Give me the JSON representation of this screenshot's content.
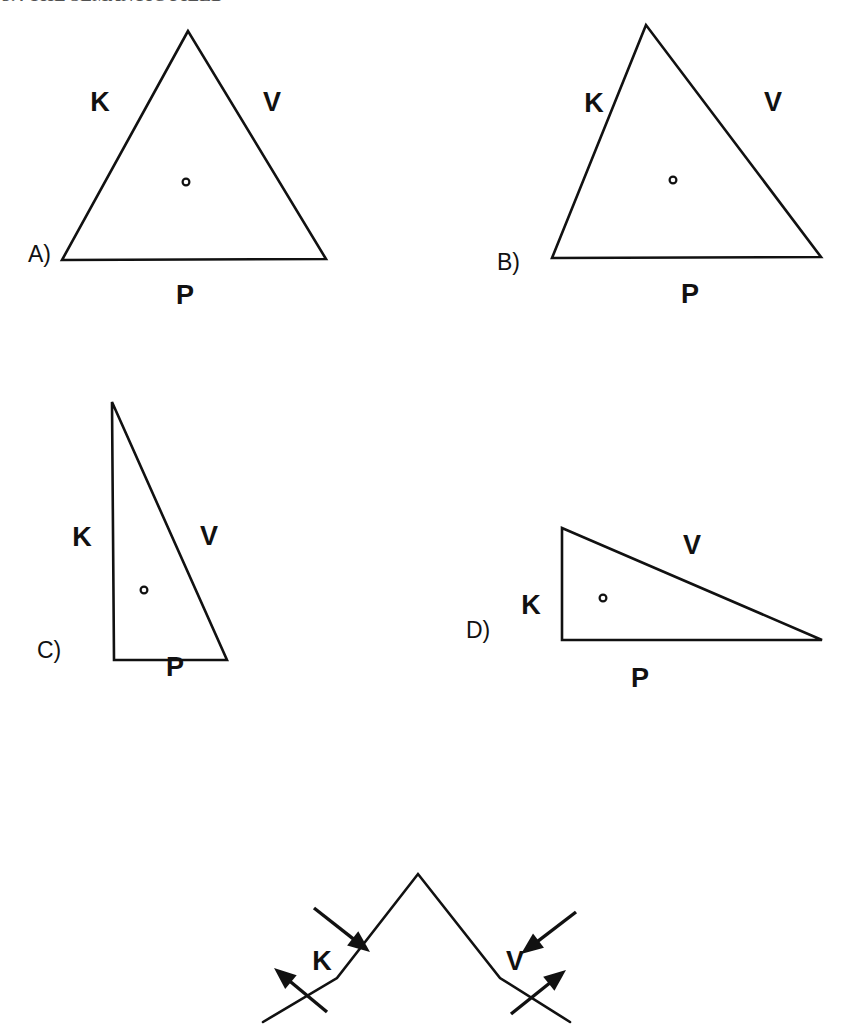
{
  "page": {
    "width": 848,
    "height": 1026,
    "background_color": "#ffffff",
    "ink_color": "#111111",
    "header_sliver_text": "3.4  THE SEMANTIC FIELD"
  },
  "figure": {
    "kind": "geometric-diagram",
    "vertex_labels": [
      "K",
      "V",
      "P"
    ],
    "panels": [
      {
        "id": "A",
        "panel_label": "A)",
        "panel_label_pos": [
          28,
          256
        ],
        "shape": "triangle",
        "vertices": [
          [
            188,
            31
          ],
          [
            62,
            260
          ],
          [
            326,
            259
          ]
        ],
        "interior_point": [
          186,
          182
        ],
        "labels": [
          {
            "text": "K",
            "pos": [
              100,
              104
            ],
            "side": "left"
          },
          {
            "text": "V",
            "pos": [
              272,
              104
            ],
            "side": "right"
          },
          {
            "text": "P",
            "pos": [
              185,
              297
            ],
            "side": "bottom"
          }
        ]
      },
      {
        "id": "B",
        "panel_label": "B)",
        "panel_label_pos": [
          497,
          264
        ],
        "shape": "triangle",
        "vertices": [
          [
            646,
            25
          ],
          [
            552,
            258
          ],
          [
            821,
            257
          ]
        ],
        "interior_point": [
          673,
          180
        ],
        "labels": [
          {
            "text": "K",
            "pos": [
              594,
              105
            ],
            "side": "left"
          },
          {
            "text": "V",
            "pos": [
              773,
              104
            ],
            "side": "right"
          },
          {
            "text": "P",
            "pos": [
              690,
              296
            ],
            "side": "bottom"
          }
        ]
      },
      {
        "id": "C",
        "panel_label": "C)",
        "panel_label_pos": [
          37,
          652
        ],
        "shape": "triangle",
        "vertices": [
          [
            112,
            402
          ],
          [
            114,
            660
          ],
          [
            227,
            660
          ]
        ],
        "interior_point": [
          144,
          590
        ],
        "labels": [
          {
            "text": "K",
            "pos": [
              82,
              539
            ],
            "side": "left"
          },
          {
            "text": "V",
            "pos": [
              209,
              538
            ],
            "side": "right"
          },
          {
            "text": "P",
            "pos": [
              175,
              669
            ],
            "side": "bottom"
          }
        ]
      },
      {
        "id": "D",
        "panel_label": "D)",
        "panel_label_pos": [
          466,
          632
        ],
        "shape": "triangle",
        "vertices": [
          [
            562,
            528
          ],
          [
            562,
            640
          ],
          [
            822,
            640
          ]
        ],
        "interior_point": [
          603,
          598
        ],
        "labels": [
          {
            "text": "K",
            "pos": [
              531,
              607
            ],
            "side": "left"
          },
          {
            "text": "V",
            "pos": [
              692,
              547
            ],
            "side": "right"
          },
          {
            "text": "P",
            "pos": [
              640,
              680
            ],
            "side": "bottom"
          }
        ]
      }
    ],
    "bottom_diagram": {
      "id": "E",
      "shape": "zigzag-w",
      "polyline": [
        [
          263,
          1022
        ],
        [
          337,
          978
        ],
        [
          418,
          874
        ],
        [
          500,
          978
        ],
        [
          570,
          1022
        ]
      ],
      "labels": [
        {
          "text": "K",
          "pos": [
            322,
            963
          ]
        },
        {
          "text": "V",
          "pos": [
            515,
            963
          ]
        }
      ],
      "arrows": [
        {
          "name": "inward-left",
          "from": [
            314,
            908
          ],
          "to": [
            370,
            952
          ]
        },
        {
          "name": "outward-left",
          "from": [
            327,
            1012
          ],
          "to": [
            274,
            968
          ]
        },
        {
          "name": "inward-right",
          "from": [
            576,
            912
          ],
          "to": [
            521,
            954
          ]
        },
        {
          "name": "outward-right",
          "from": [
            511,
            1014
          ],
          "to": [
            566,
            970
          ]
        }
      ]
    }
  }
}
